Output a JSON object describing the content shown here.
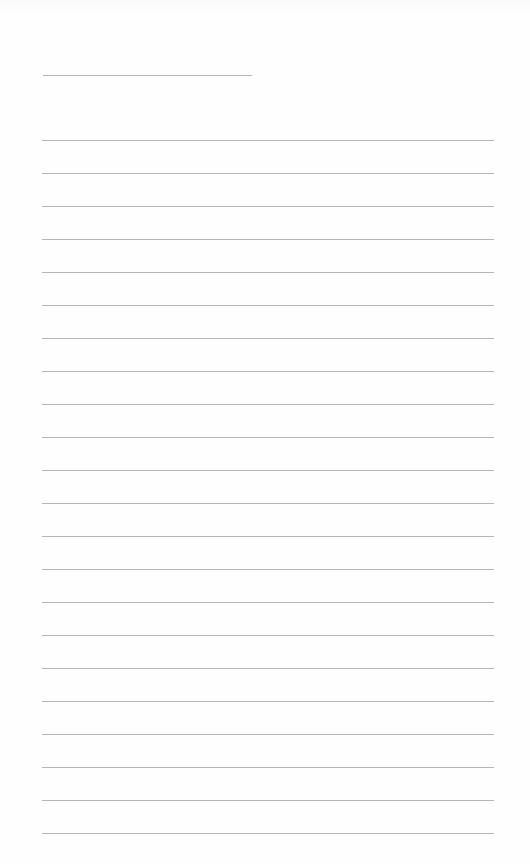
{
  "document": {
    "type": "lined-paper",
    "header_line": {
      "top": 75,
      "left": 43,
      "width": 209
    },
    "ruled_lines": {
      "count": 22,
      "first_top": 140,
      "spacing": 33,
      "left": 42,
      "width": 452
    },
    "line_color": "#a8a8a8",
    "background_color": "#fefefe"
  }
}
